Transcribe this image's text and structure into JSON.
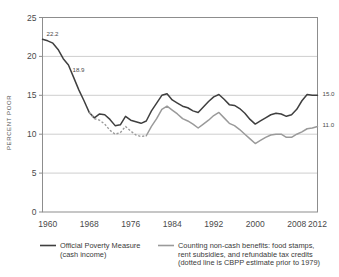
{
  "chart_data": {
    "type": "line",
    "title": "",
    "xlabel": "",
    "ylabel": "PERCENT POOR",
    "xlim": [
      1959,
      2012
    ],
    "ylim": [
      0,
      25
    ],
    "grid": true,
    "legend_position": "bottom",
    "y_ticks": [
      "0",
      "5",
      "10",
      "15",
      "20",
      "25"
    ],
    "y_tick_values": [
      0,
      5,
      10,
      15,
      20,
      25
    ],
    "x_ticks": [
      "1960",
      "1968",
      "1976",
      "1984",
      "1992",
      "2000",
      "2008",
      "2012"
    ],
    "x_tick_values": [
      1960,
      1968,
      1976,
      1984,
      1992,
      2000,
      2008,
      2012
    ],
    "annotations": [
      {
        "text": "22.2",
        "x": 1959,
        "y": 22.2
      },
      {
        "text": "18.9",
        "x": 1964,
        "y": 18.9
      },
      {
        "text": "15.0",
        "x": 2012,
        "y": 15.0
      },
      {
        "text": "11.0",
        "x": 2012,
        "y": 11.0
      }
    ],
    "series": [
      {
        "name": "Official Poverty Measure (cash income)",
        "color": "#3f3f3f",
        "style": "solid",
        "x": [
          1959,
          1960,
          1961,
          1962,
          1963,
          1964,
          1965,
          1966,
          1967,
          1968,
          1969,
          1970,
          1971,
          1972,
          1973,
          1974,
          1975,
          1976,
          1977,
          1978,
          1979,
          1980,
          1981,
          1982,
          1983,
          1984,
          1985,
          1986,
          1987,
          1988,
          1989,
          1990,
          1991,
          1992,
          1993,
          1994,
          1995,
          1996,
          1997,
          1998,
          1999,
          2000,
          2001,
          2002,
          2003,
          2004,
          2005,
          2006,
          2007,
          2008,
          2009,
          2010,
          2011,
          2012
        ],
        "values": [
          22.2,
          22.0,
          21.7,
          20.9,
          19.7,
          18.9,
          17.3,
          15.7,
          14.3,
          12.8,
          12.1,
          12.6,
          12.5,
          11.9,
          11.1,
          11.2,
          12.3,
          11.8,
          11.6,
          11.4,
          11.7,
          13.0,
          14.0,
          15.0,
          15.2,
          14.4,
          14.0,
          13.6,
          13.4,
          13.0,
          12.8,
          13.5,
          14.2,
          14.8,
          15.1,
          14.5,
          13.8,
          13.7,
          13.3,
          12.7,
          11.9,
          11.3,
          11.7,
          12.1,
          12.5,
          12.7,
          12.6,
          12.3,
          12.5,
          13.2,
          14.3,
          15.1,
          15.0,
          15.0
        ]
      },
      {
        "name": "Counting non-cash benefits: food stamps, rent subsidies, and refundable tax credits",
        "color": "#9a9a9a",
        "style": "dotted-before-1979",
        "x": [
          1968,
          1969,
          1970,
          1971,
          1972,
          1973,
          1974,
          1975,
          1976,
          1977,
          1978,
          1979,
          1980,
          1981,
          1982,
          1983,
          1984,
          1985,
          1986,
          1987,
          1988,
          1989,
          1990,
          1991,
          1992,
          1993,
          1994,
          1995,
          1996,
          1997,
          1998,
          1999,
          2000,
          2001,
          2002,
          2003,
          2004,
          2005,
          2006,
          2007,
          2008,
          2009,
          2010,
          2011,
          2012
        ],
        "values": [
          12.8,
          12.0,
          11.8,
          11.3,
          10.5,
          10.0,
          10.2,
          11.0,
          10.4,
          9.9,
          9.7,
          9.8,
          11.0,
          12.0,
          13.2,
          13.6,
          13.1,
          12.6,
          12.0,
          11.7,
          11.3,
          10.8,
          11.3,
          11.8,
          12.4,
          12.8,
          12.1,
          11.4,
          11.1,
          10.6,
          10.0,
          9.4,
          8.8,
          9.2,
          9.6,
          9.9,
          10.0,
          10.0,
          9.6,
          9.6,
          10.0,
          10.3,
          10.7,
          10.8,
          11.0
        ]
      }
    ]
  },
  "legend": {
    "entries": [
      {
        "swatch": "line-dark",
        "lines": [
          "Official Poverty Measure",
          "(cash income)"
        ]
      },
      {
        "swatch": "line-light",
        "lines": [
          "Counting non-cash benefits: food stamps,",
          "rent subsidies, and refundable tax credits",
          "(dotted line is CBPP estimate prior to 1979)"
        ]
      }
    ]
  }
}
